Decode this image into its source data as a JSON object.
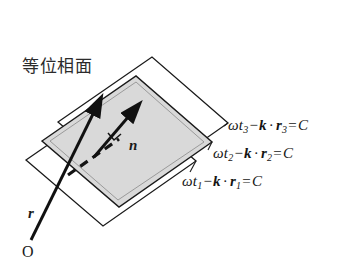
{
  "figure": {
    "caption_jp": "等位相面",
    "caption_meaning": "equiphase surface",
    "origin_label": "O",
    "vectors": [
      {
        "name": "position-vector",
        "label": "r"
      },
      {
        "name": "normal-vector",
        "label": "n"
      }
    ],
    "equations": [
      {
        "id": "eq3",
        "plane": "back",
        "omega": "ω",
        "t": "t",
        "t_sub": "3",
        "minus": "−",
        "k": "k",
        "dot": "·",
        "r": "r",
        "r_sub": "3",
        "equals": "=",
        "constant": "C",
        "plain": "ωt₃ − k·r₃ = C"
      },
      {
        "id": "eq2",
        "plane": "middle",
        "omega": "ω",
        "t": "t",
        "t_sub": "2",
        "minus": "−",
        "k": "k",
        "dot": "·",
        "r": "r",
        "r_sub": "2",
        "equals": "=",
        "constant": "C",
        "plain": "ωt₂ − k·r₂ = C"
      },
      {
        "id": "eq1",
        "plane": "front",
        "omega": "ω",
        "t": "t",
        "t_sub": "1",
        "minus": "−",
        "k": "k",
        "dot": "·",
        "r": "r",
        "r_sub": "1",
        "equals": "=",
        "constant": "C",
        "plain": "ωt₁ − k·r₁ = C"
      }
    ],
    "colors": {
      "stroke": "#1a1a1a",
      "plane_fill_gray": "#d9d9d9",
      "plane_fill_white": "#ffffff",
      "background": "#ffffff",
      "text": "#1a1a1a"
    },
    "planes": [
      {
        "name": "plane-back",
        "fill": "#ffffff"
      },
      {
        "name": "plane-middle",
        "fill": "#d9d9d9"
      },
      {
        "name": "plane-front",
        "fill": "#ffffff"
      }
    ]
  }
}
